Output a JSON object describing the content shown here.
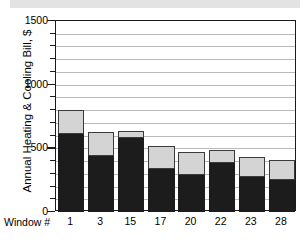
{
  "figure": {
    "scan_band": true,
    "background_color": "#ffffff"
  },
  "axes": {
    "y_title": "Annual Heating & Cooling Bill, $",
    "x_caption": "Window #",
    "y_tick_labels": [
      "1500",
      "1000",
      "500",
      "0"
    ],
    "y_major_ticks": [
      0,
      500,
      1000,
      1500
    ],
    "y_minor_step": 100
  },
  "colors": {
    "bar_dark": "#1c1c1c",
    "bar_light": "#d4d4d4",
    "grid": "#b9b9b9",
    "frame": "#1a1a1a",
    "scan_band": "#e3e3e3"
  },
  "chart_data": {
    "type": "bar",
    "title": "",
    "xlabel": "Window #",
    "ylabel": "Annual Heating & Cooling Bill, $",
    "ylim": [
      0,
      1500
    ],
    "grid": true,
    "legend": "none",
    "stacked": true,
    "categories": [
      "1",
      "3",
      "15",
      "17",
      "20",
      "22",
      "23",
      "28"
    ],
    "series": [
      {
        "name": "Heating",
        "values": [
          610,
          440,
          585,
          340,
          290,
          385,
          275,
          250
        ]
      },
      {
        "name": "Cooling",
        "values": [
          190,
          190,
          55,
          180,
          185,
          100,
          155,
          160
        ]
      }
    ],
    "totals": [
      800,
      630,
      640,
      520,
      475,
      485,
      430,
      410
    ]
  }
}
